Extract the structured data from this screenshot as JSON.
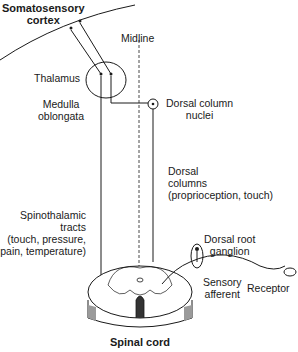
{
  "labels": {
    "cortex": [
      "Somatosensory",
      "cortex"
    ],
    "midline": "Midline",
    "thalamus": "Thalamus",
    "medulla": [
      "Medulla",
      "oblongata"
    ],
    "dorsal_column_nuclei": [
      "Dorsal column",
      "nuclei"
    ],
    "dorsal_columns": [
      "Dorsal",
      "columns",
      "(proprioception, touch)"
    ],
    "spinothalamic": [
      "Spinothalamic",
      "tracts",
      "(touch, pressure,",
      "pain, temperature)"
    ],
    "drg": [
      "Dorsal root",
      "ganglion"
    ],
    "sensory_afferent": [
      "Sensory",
      "afferent"
    ],
    "receptor": "Receptor",
    "spinal_cord": "Spinal cord"
  },
  "colors": {
    "line": "#1a1a1a",
    "shade": "#9a9a9a",
    "background": "#ffffff"
  }
}
